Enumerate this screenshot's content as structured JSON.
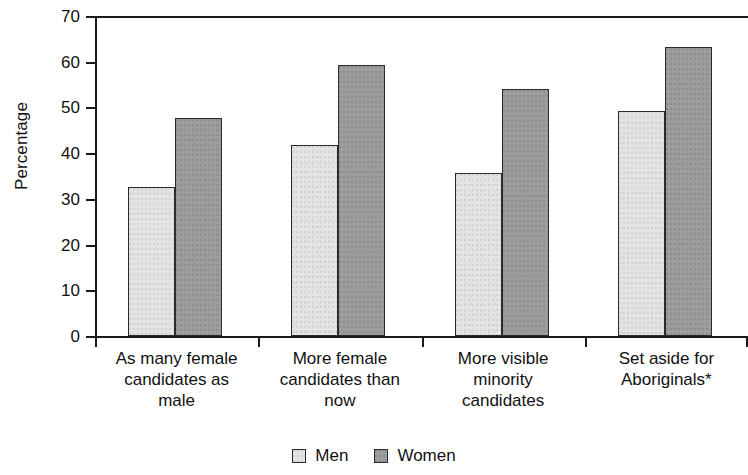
{
  "chart_data": {
    "type": "bar",
    "title": "",
    "subtitle": "",
    "xlabel": "",
    "ylabel": "Percentage",
    "ylim": [
      0,
      70
    ],
    "ytick_labels": [
      "0",
      "10",
      "20",
      "30",
      "40",
      "50",
      "60",
      "70"
    ],
    "ytick_values": [
      0,
      10,
      20,
      30,
      40,
      50,
      60,
      70
    ],
    "grid": false,
    "legend_position": "bottom",
    "categories": [
      "As many female candidates as male",
      "More female candidates than now",
      "More visible minority candidates",
      "Set aside for Aboriginals*"
    ],
    "category_lines": [
      [
        "As many female",
        "candidates as",
        "male"
      ],
      [
        "More female",
        "candidates than",
        "now"
      ],
      [
        "More visible",
        "minority",
        "candidates"
      ],
      [
        "Set aside for",
        "Aboriginals*"
      ]
    ],
    "series": [
      {
        "name": "Men",
        "color": "#e4e4e4",
        "values": [
          32.5,
          41.8,
          35.7,
          49.3
        ]
      },
      {
        "name": "Women",
        "color": "#9c9c9c",
        "values": [
          47.7,
          59.2,
          54.1,
          63.2
        ]
      }
    ],
    "annotations": [
      "*"
    ]
  },
  "legend": {
    "items": [
      {
        "label": "Men",
        "swatch": "light-square-swatch"
      },
      {
        "label": "Women",
        "swatch": "dark-square-swatch"
      }
    ]
  },
  "axes": {
    "y_title": "Percentage"
  }
}
